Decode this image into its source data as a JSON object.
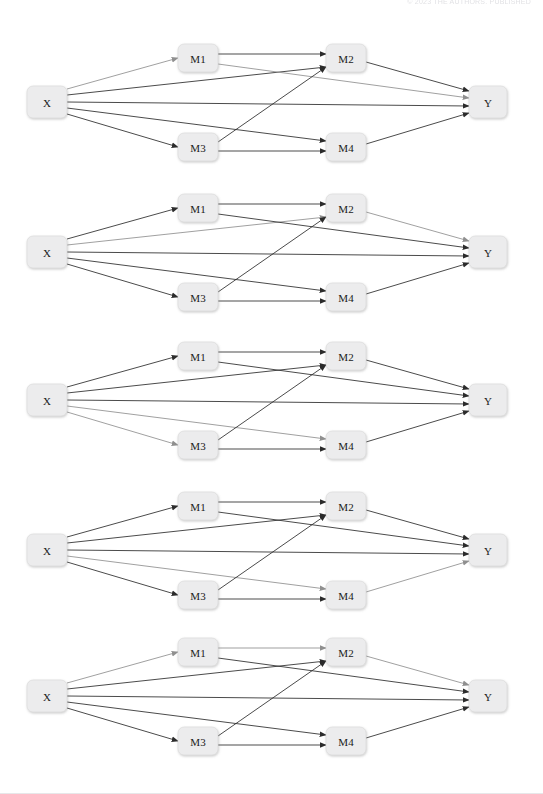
{
  "page": {
    "header_text": "© 2023 THE AUTHORS. PUBLISHED",
    "background_color": "#ffffff"
  },
  "style": {
    "node_fill": "#ececed",
    "node_stroke": "#d8d8d9",
    "edge_dark_color": "#2b2b2b",
    "edge_gray_color": "#8f8f8f",
    "label_color": "#1a1a1a"
  },
  "node_labels": {
    "x": "X",
    "m1": "M1",
    "m2": "M2",
    "m3": "M3",
    "m4": "M4",
    "y": "Y"
  },
  "diagrams": [
    {
      "id": "diagram-1",
      "top": 30,
      "highlighted_edges": [
        "X->M1",
        "M1->Y"
      ],
      "edges": [
        {
          "id": "X->M1",
          "state": "gray"
        },
        {
          "id": "X->M2",
          "state": "dark"
        },
        {
          "id": "X->Y",
          "state": "dark"
        },
        {
          "id": "X->M4",
          "state": "dark"
        },
        {
          "id": "X->M3",
          "state": "dark"
        },
        {
          "id": "M1->M2",
          "state": "dark"
        },
        {
          "id": "M1->Y",
          "state": "gray"
        },
        {
          "id": "M3->M2",
          "state": "dark"
        },
        {
          "id": "M3->M4",
          "state": "dark"
        },
        {
          "id": "M2->Y",
          "state": "dark"
        },
        {
          "id": "M4->Y",
          "state": "dark"
        }
      ]
    },
    {
      "id": "diagram-2",
      "top": 180,
      "highlighted_edges": [
        "M1->M2",
        "M2->Y"
      ],
      "edges": [
        {
          "id": "X->M1",
          "state": "dark"
        },
        {
          "id": "X->M2",
          "state": "gray"
        },
        {
          "id": "X->Y",
          "state": "dark"
        },
        {
          "id": "X->M4",
          "state": "dark"
        },
        {
          "id": "X->M3",
          "state": "dark"
        },
        {
          "id": "M1->M2",
          "state": "dark"
        },
        {
          "id": "M1->Y",
          "state": "dark"
        },
        {
          "id": "M3->M2",
          "state": "dark"
        },
        {
          "id": "M3->M4",
          "state": "dark"
        },
        {
          "id": "M2->Y",
          "state": "gray"
        },
        {
          "id": "M4->Y",
          "state": "dark"
        }
      ]
    },
    {
      "id": "diagram-3",
      "top": 328,
      "highlighted_edges": [
        "X->M3",
        "M3->Y"
      ],
      "edges": [
        {
          "id": "X->M1",
          "state": "dark"
        },
        {
          "id": "X->M2",
          "state": "dark"
        },
        {
          "id": "X->Y",
          "state": "dark"
        },
        {
          "id": "X->M4",
          "state": "gray"
        },
        {
          "id": "X->M3",
          "state": "gray"
        },
        {
          "id": "M1->M2",
          "state": "dark"
        },
        {
          "id": "M1->Y",
          "state": "dark"
        },
        {
          "id": "M3->M2",
          "state": "dark"
        },
        {
          "id": "M3->M4",
          "state": "dark"
        },
        {
          "id": "M2->Y",
          "state": "dark"
        },
        {
          "id": "M4->Y",
          "state": "dark"
        }
      ]
    },
    {
      "id": "diagram-4",
      "top": 478,
      "highlighted_edges": [
        "X->M4",
        "M4->Y"
      ],
      "edges": [
        {
          "id": "X->M1",
          "state": "dark"
        },
        {
          "id": "X->M2",
          "state": "dark"
        },
        {
          "id": "X->Y",
          "state": "dark"
        },
        {
          "id": "X->M4",
          "state": "gray"
        },
        {
          "id": "X->M3",
          "state": "dark"
        },
        {
          "id": "M1->M2",
          "state": "dark"
        },
        {
          "id": "M1->Y",
          "state": "dark"
        },
        {
          "id": "M3->M2",
          "state": "dark"
        },
        {
          "id": "M3->M4",
          "state": "dark"
        },
        {
          "id": "M2->Y",
          "state": "dark"
        },
        {
          "id": "M4->Y",
          "state": "gray"
        }
      ]
    },
    {
      "id": "diagram-5",
      "top": 624,
      "highlighted_edges": [
        "X->M1",
        "M1->M2",
        "M2->Y"
      ],
      "edges": [
        {
          "id": "X->M1",
          "state": "gray"
        },
        {
          "id": "X->M2",
          "state": "dark"
        },
        {
          "id": "X->Y",
          "state": "dark"
        },
        {
          "id": "X->M4",
          "state": "dark"
        },
        {
          "id": "X->M3",
          "state": "dark"
        },
        {
          "id": "M1->M2",
          "state": "gray"
        },
        {
          "id": "M1->Y",
          "state": "dark"
        },
        {
          "id": "M3->M2",
          "state": "dark"
        },
        {
          "id": "M3->M4",
          "state": "dark"
        },
        {
          "id": "M2->Y",
          "state": "gray"
        },
        {
          "id": "M4->Y",
          "state": "dark"
        }
      ]
    }
  ],
  "geometry": {
    "nodes": {
      "x": {
        "cx": 47,
        "cy": 72,
        "w": 40,
        "h": 32
      },
      "m1": {
        "cx": 198,
        "cy": 28,
        "w": 40,
        "h": 28
      },
      "m2": {
        "cx": 346,
        "cy": 28,
        "w": 40,
        "h": 28
      },
      "m3": {
        "cx": 198,
        "cy": 117,
        "w": 40,
        "h": 28
      },
      "m4": {
        "cx": 346,
        "cy": 117,
        "w": 40,
        "h": 28
      },
      "y": {
        "cx": 488,
        "cy": 72,
        "w": 38,
        "h": 32
      }
    }
  }
}
